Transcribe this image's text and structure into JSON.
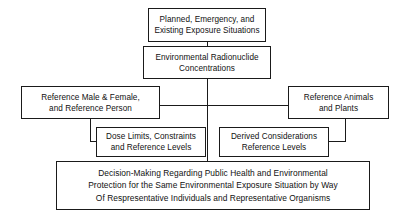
{
  "diagram": {
    "colors": {
      "stroke": "#1a1a1a",
      "text": "#111111",
      "background": "#ffffff"
    },
    "nodes": {
      "situations": {
        "lines": [
          "Planned, Emergency, and",
          "Existing Exposure Situations"
        ]
      },
      "concentrations": {
        "lines": [
          "Environmental Radionuclide",
          "Concentrations"
        ]
      },
      "reference_person": {
        "lines": [
          "Reference Male & Female,",
          "and Reference Person"
        ]
      },
      "reference_animals": {
        "lines": [
          "Reference Animals",
          "and Plants"
        ]
      },
      "dose_limits": {
        "lines": [
          "Dose Limits, Constraints",
          "and Reference Levels"
        ]
      },
      "derived_considerations": {
        "lines": [
          "Derived Considerations",
          "Reference Levels"
        ]
      },
      "decision": {
        "lines": [
          "Decision-Making Regarding Public Health and Environmental",
          "Protection for the Same Environmental Exposure Situation by Way",
          "Of Respresentative Individuals and Representative Organisms"
        ]
      }
    }
  }
}
